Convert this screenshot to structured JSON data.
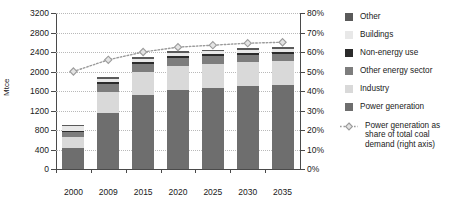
{
  "chart_data": {
    "type": "bar",
    "stacked": true,
    "title": "",
    "xlabel": "",
    "ylabel": "Mtce",
    "categories": [
      "2000",
      "2009",
      "2015",
      "2020",
      "2025",
      "2030",
      "2035"
    ],
    "ylim": [
      0,
      3200
    ],
    "yticks": [
      "0",
      "400",
      "800",
      "1200",
      "1600",
      "2000",
      "2400",
      "2800",
      "3200"
    ],
    "y2label": "",
    "y2lim": [
      0,
      80
    ],
    "y2ticks": [
      "0%",
      "10%",
      "20%",
      "30%",
      "40%",
      "50%",
      "60%",
      "70%",
      "80%"
    ],
    "grid": true,
    "legend_position": "right",
    "series": [
      {
        "name": "Power generation",
        "color": "#6e6e6e",
        "values": [
          430,
          1155,
          1515,
          1630,
          1665,
          1700,
          1720
        ]
      },
      {
        "name": "Industry",
        "color": "#d9d9d9",
        "values": [
          225,
          430,
          470,
          490,
          495,
          500,
          505
        ]
      },
      {
        "name": "Other energy sector",
        "color": "#7d7d7d",
        "values": [
          95,
          155,
          165,
          160,
          150,
          145,
          140
        ]
      },
      {
        "name": "Non-energy use",
        "color": "#2b2b2b",
        "values": [
          30,
          40,
          45,
          45,
          45,
          45,
          45
        ]
      },
      {
        "name": "Buildings",
        "color": "#e8e8e8",
        "values": [
          95,
          75,
          70,
          65,
          60,
          55,
          55
        ]
      },
      {
        "name": "Other",
        "color": "#5a5a5a",
        "values": [
          35,
          35,
          35,
          35,
          35,
          35,
          35
        ]
      }
    ],
    "line_series": {
      "name": "Power generation as share of total coal demand (right axis)",
      "color": "#9b9b9b",
      "marker": "diamond",
      "linestyle": "dotted",
      "axis": "right",
      "values": [
        50,
        56,
        60,
        62.5,
        63.5,
        64.5,
        65
      ]
    }
  },
  "legend": {
    "items": [
      {
        "label": "Other",
        "color": "#5a5a5a"
      },
      {
        "label": "Buildings",
        "color": "#e8e8e8"
      },
      {
        "label": "Non-energy use",
        "color": "#2b2b2b"
      },
      {
        "label": "Other energy sector",
        "color": "#7d7d7d"
      },
      {
        "label": "Industry",
        "color": "#d9d9d9"
      },
      {
        "label": "Power generation",
        "color": "#6e6e6e"
      }
    ],
    "line_item": {
      "label": "Power generation as share of total coal demand (right axis)",
      "color": "#9b9b9b"
    }
  }
}
